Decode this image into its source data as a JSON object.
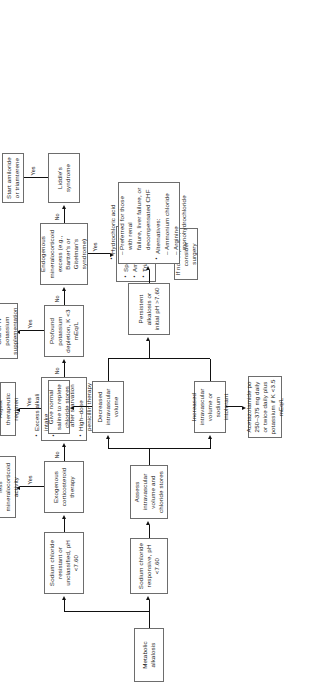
{
  "figure": {
    "orientation": "rotated-90-ccw"
  },
  "nodes": {
    "root": "Metabolic alkalosis",
    "nacl_responsive": "Sodium chloride responsive, pH <7.60",
    "nacl_resistant": "Sodium chloride resistant or unclassified, pH <7.60",
    "assess_volume": "Assess intravascular volume and chloride stores",
    "decreased_volume": "Decreased intravascular volume",
    "increased_volume": "Increased intravascular volume or sodium intolerant",
    "normal_saline": "Give normal saline to replete chloride stores",
    "acetazolamide": "Acetazolamide po 250–375 mg daily or twice daily plus potassium if K <3.5 mEq/L",
    "persistent": "Persistent alkalosis or initial pH >7.60",
    "exogenous_steroid": "Exogenous corticosteroid therapy",
    "decrease_dose": "Decrease dose or change to one with less mineralocorticoid activity",
    "adjust_regimen": "Adjust therapeutic regimen",
    "profound_k": "Profound potassium depletion, K <3 mEq/L",
    "oral_iv_k": "Oral or IV potassium supplementation",
    "endogenous_excess": "Endogenous mineralocorticoid excess (e.g., Bartter's or Gitelman's syndrome)",
    "liddles": "Liddle's syndrome",
    "start_amiloride": "Start amiloride or triamterene",
    "if_no_response": "If no response, consider surgery"
  },
  "alkali_list": {
    "items": [
      {
        "kind": "bullet",
        "text": "Excess alkali intake"
      },
      {
        "kind": "bullet",
        "text": "Glucose ingestion"
      },
      {
        "kind": "cont",
        "text": "after starvation"
      },
      {
        "kind": "bullet",
        "text": "High–dose penicillin therapy"
      }
    ]
  },
  "hcl_list": {
    "items": [
      {
        "kind": "bullet",
        "text": "Hydrochloric acid"
      },
      {
        "kind": "dash",
        "text": "Preferred for those with renal"
      },
      {
        "kind": "cont",
        "text": "failure, liver failure, or"
      },
      {
        "kind": "cont",
        "text": "decompensated CHF"
      },
      {
        "kind": "bullet",
        "text": "Alternatives:"
      },
      {
        "kind": "dash",
        "text": "Ammonium chloride"
      },
      {
        "kind": "dash",
        "text": "Arginine monohydrochloride"
      }
    ]
  },
  "diuretic_list": {
    "items": [
      {
        "kind": "bullet",
        "text": "Spironolactone"
      },
      {
        "kind": "bullet",
        "text": "Amiloride"
      },
      {
        "kind": "bullet",
        "text": "Triamterene"
      }
    ]
  },
  "edge_labels": {
    "yes_1": "Yes",
    "no_1": "No",
    "yes_2": "Yes",
    "no_2": "No",
    "yes_3": "Yes",
    "no_3": "No",
    "yes_4": "Yes",
    "no_4": "No",
    "yes_5": "Yes"
  },
  "colors": {
    "node_border": "#6d6d6d",
    "line": "#111111",
    "text": "#1a1a1a",
    "background": "#ffffff"
  }
}
